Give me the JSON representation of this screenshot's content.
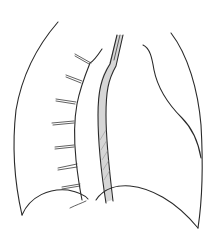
{
  "figure": {
    "colors": {
      "line": "#2a2a2a",
      "shading": "#d6d6d6",
      "background": "#ffffff"
    },
    "parts": {
      "left_lung_outline": "left-lung-outline",
      "right_lung_outline": "right-lung-outline",
      "heart_border": "heart-border",
      "central_tube": "central-tube",
      "rib_stubs_count": 7
    }
  }
}
